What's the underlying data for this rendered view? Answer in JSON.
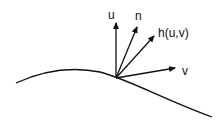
{
  "diagram": {
    "type": "surface-vectors",
    "labels": {
      "u": "u",
      "n": "n",
      "h": "h(u,v)",
      "v": "v"
    },
    "colors": {
      "stroke": "#111111",
      "background": "#ffffff"
    }
  }
}
